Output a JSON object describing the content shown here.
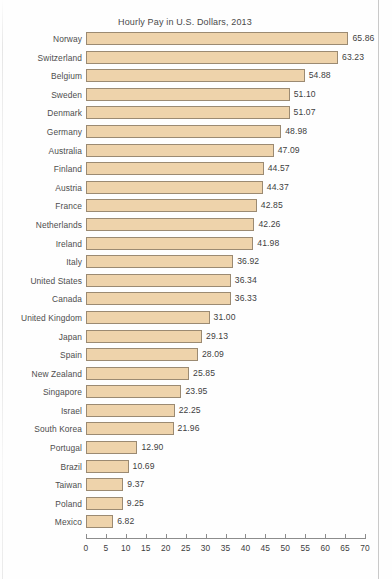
{
  "chart_data": {
    "type": "bar",
    "orientation": "horizontal",
    "title": "Hourly Pay in U.S. Dollars, 2013",
    "xlabel": "",
    "ylabel": "",
    "xlim": [
      0,
      70
    ],
    "grid": false,
    "legend": null,
    "bar_fill_color": "#eed3ab",
    "bar_border_color": "#9b8a72",
    "text_color": "#4a4a4a",
    "xticks": [
      0,
      5,
      10,
      15,
      20,
      25,
      30,
      35,
      40,
      45,
      50,
      55,
      60,
      65,
      70
    ],
    "xtick_labels": [
      "0",
      "5",
      "10",
      "15",
      "20",
      "25",
      "30",
      "35",
      "40",
      "45",
      "50",
      "55",
      "60",
      "65",
      "70"
    ],
    "categories": [
      "Norway",
      "Switzerland",
      "Belgium",
      "Sweden",
      "Denmark",
      "Germany",
      "Australia",
      "Finland",
      "Austria",
      "France",
      "Netherlands",
      "Ireland",
      "Italy",
      "United States",
      "Canada",
      "United Kingdom",
      "Japan",
      "Spain",
      "New Zealand",
      "Singapore",
      "Israel",
      "South Korea",
      "Portugal",
      "Brazil",
      "Taiwan",
      "Poland",
      "Mexico"
    ],
    "values": [
      65.86,
      63.23,
      54.88,
      51.1,
      51.07,
      48.98,
      47.09,
      44.57,
      44.37,
      42.85,
      42.26,
      41.98,
      36.92,
      36.34,
      36.33,
      31.0,
      29.13,
      28.09,
      25.85,
      23.95,
      22.25,
      21.96,
      12.9,
      10.69,
      9.37,
      9.25,
      6.82
    ],
    "value_labels": [
      "65.86",
      "63.23",
      "54.88",
      "51.10",
      "51.07",
      "48.98",
      "47.09",
      "44.57",
      "44.37",
      "42.85",
      "42.26",
      "41.98",
      "36.92",
      "36.34",
      "36.33",
      "31.00",
      "29.13",
      "28.09",
      "25.85",
      "23.95",
      "22.25",
      "21.96",
      "12.90",
      "10.69",
      "9.37",
      "9.25",
      "6.82"
    ]
  }
}
